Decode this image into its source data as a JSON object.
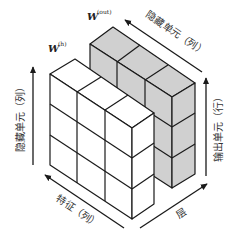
{
  "diagram": {
    "type": "3d-weight-matrix-cube",
    "weights": {
      "hidden": {
        "symbol": "W",
        "superscript": "(h)"
      },
      "output": {
        "symbol": "W",
        "superscript": "(out)"
      }
    },
    "axes": {
      "hidden_units_vertical": "隐藏单元（列）",
      "hidden_units_diagonal": "隐藏单元（列）",
      "output_units": "输出单元（行）",
      "features": "特征（列）",
      "layers": "层"
    },
    "blocks": [
      {
        "name": "W(h)",
        "color": "#ffffff",
        "cells": {
          "features": 3,
          "hidden": 3,
          "depth": 1
        }
      },
      {
        "name": "W(out)",
        "color": "#d0d0d0",
        "cells": {
          "hidden": 3,
          "output": 3,
          "depth": 1
        }
      }
    ]
  }
}
